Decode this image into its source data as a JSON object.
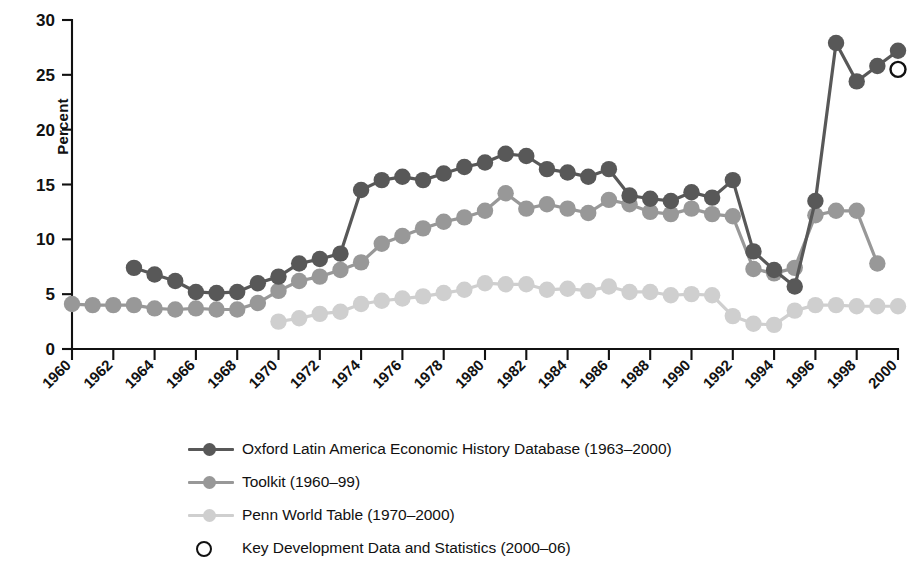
{
  "chart_data": {
    "type": "line",
    "title": "",
    "subtitle": "",
    "xlabel": "",
    "ylabel": "Percent",
    "ylim": [
      0,
      30
    ],
    "xlim": [
      1960,
      2000
    ],
    "ytick_labels": [
      "0",
      "5",
      "10",
      "15",
      "20",
      "25",
      "30"
    ],
    "yticks": [
      0,
      5,
      10,
      15,
      20,
      25,
      30
    ],
    "xtick_labels": [
      "1960",
      "1962",
      "1964",
      "1966",
      "1968",
      "1970",
      "1972",
      "1974",
      "1976",
      "1978",
      "1980",
      "1982",
      "1984",
      "1986",
      "1988",
      "1990",
      "1992",
      "1994",
      "1996",
      "1998",
      "2000"
    ],
    "xticks": [
      1960,
      1962,
      1964,
      1966,
      1968,
      1970,
      1972,
      1974,
      1976,
      1978,
      1980,
      1982,
      1984,
      1986,
      1988,
      1990,
      1992,
      1994,
      1996,
      1998,
      2000
    ],
    "grid": false,
    "legend_position": "below",
    "series": [
      {
        "name": "Oxford Latin America Economic History Database (1963–2000)",
        "color": "#585858",
        "marker": "filled-circle",
        "x": [
          1963,
          1964,
          1965,
          1966,
          1967,
          1968,
          1969,
          1970,
          1971,
          1972,
          1973,
          1974,
          1975,
          1976,
          1977,
          1978,
          1979,
          1980,
          1981,
          1982,
          1983,
          1984,
          1985,
          1986,
          1987,
          1988,
          1989,
          1990,
          1991,
          1992,
          1993,
          1994,
          1995,
          1996,
          1997,
          1998,
          1999,
          2000
        ],
        "values": [
          7.4,
          6.8,
          6.2,
          5.2,
          5.1,
          5.2,
          6.0,
          6.6,
          7.8,
          8.2,
          8.7,
          14.5,
          15.4,
          15.7,
          15.4,
          16.0,
          16.6,
          17.0,
          17.8,
          17.6,
          16.4,
          16.1,
          15.7,
          16.4,
          14.0,
          13.7,
          13.5,
          14.3,
          13.8,
          15.4,
          8.9,
          7.2,
          5.7,
          13.5,
          27.9,
          24.4,
          25.8,
          27.2
        ]
      },
      {
        "name": "Toolkit (1960–99)",
        "color": "#989898",
        "marker": "filled-circle",
        "x": [
          1960,
          1961,
          1962,
          1963,
          1964,
          1965,
          1966,
          1967,
          1968,
          1969,
          1970,
          1971,
          1972,
          1973,
          1974,
          1975,
          1976,
          1977,
          1978,
          1979,
          1980,
          1981,
          1982,
          1983,
          1984,
          1985,
          1986,
          1987,
          1988,
          1989,
          1990,
          1991,
          1992,
          1993,
          1994,
          1995,
          1996,
          1997,
          1998,
          1999
        ],
        "values": [
          4.1,
          4.0,
          4.0,
          4.0,
          3.7,
          3.6,
          3.7,
          3.6,
          3.6,
          4.2,
          5.3,
          6.2,
          6.6,
          7.2,
          7.9,
          9.6,
          10.3,
          11.0,
          11.6,
          12.0,
          12.6,
          14.2,
          12.8,
          13.2,
          12.8,
          12.4,
          13.6,
          13.2,
          12.5,
          12.3,
          12.8,
          12.3,
          12.1,
          7.3,
          6.9,
          7.4,
          12.2,
          12.6,
          12.6,
          7.8
        ]
      },
      {
        "name": "Penn World Table (1970–2000)",
        "color": "#cfcfcf",
        "marker": "filled-circle",
        "x": [
          1970,
          1971,
          1972,
          1973,
          1974,
          1975,
          1976,
          1977,
          1978,
          1979,
          1980,
          1981,
          1982,
          1983,
          1984,
          1985,
          1986,
          1987,
          1988,
          1989,
          1990,
          1991,
          1992,
          1993,
          1994,
          1995,
          1996,
          1997,
          1998,
          1999,
          2000
        ],
        "values": [
          2.5,
          2.8,
          3.2,
          3.4,
          4.1,
          4.4,
          4.6,
          4.8,
          5.1,
          5.4,
          6.0,
          5.9,
          5.9,
          5.4,
          5.5,
          5.3,
          5.7,
          5.2,
          5.2,
          4.9,
          5.0,
          4.9,
          3.0,
          2.3,
          2.2,
          3.5,
          4.0,
          4.0,
          3.9,
          3.9,
          3.9
        ]
      },
      {
        "name": "Key Development Data and Statistics (2000–06)",
        "color": "#111111",
        "marker": "open-circle",
        "x": [
          2000
        ],
        "values": [
          25.5
        ]
      }
    ]
  },
  "axis": {
    "ylabel": "Percent"
  },
  "legend": {
    "items": [
      {
        "label": "Oxford Latin America Economic History Database (1963–2000)",
        "color": "#585858",
        "marker": "filled-circle"
      },
      {
        "label": "Toolkit (1960–99)",
        "color": "#989898",
        "marker": "filled-circle"
      },
      {
        "label": "Penn World Table (1970–2000)",
        "color": "#cfcfcf",
        "marker": "filled-circle"
      },
      {
        "label": "Key Development Data and Statistics (2000–06)",
        "color": "#111111",
        "marker": "open-circle"
      }
    ]
  }
}
